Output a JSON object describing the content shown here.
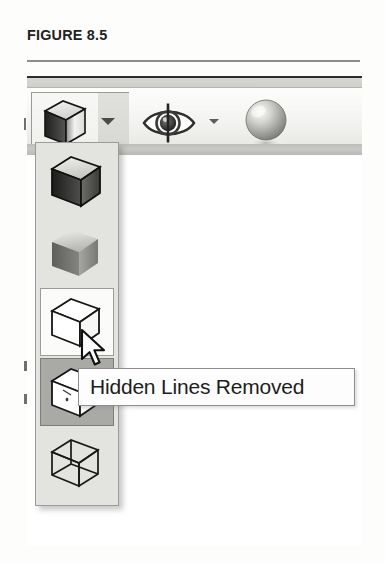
{
  "figure": {
    "caption": "FIGURE 8.5"
  },
  "toolbar": {
    "name": "view-styles-toolbar",
    "buttons": [
      {
        "id": "visual-style-cube",
        "icon": "shaded-cube-icon",
        "label": "Visual Style"
      },
      {
        "id": "visual-style-dropdown",
        "icon": "chevron-down-icon",
        "label": "Visual Style Dropdown"
      },
      {
        "id": "visibility-eye",
        "icon": "eye-icon",
        "label": "Visibility"
      },
      {
        "id": "visibility-dropdown",
        "icon": "chevron-down-icon",
        "label": "Visibility Dropdown"
      },
      {
        "id": "shading-sphere",
        "icon": "sphere-icon",
        "label": "Shading"
      }
    ]
  },
  "flyout": {
    "name": "visual-style-flyout",
    "items": [
      {
        "id": "realistic",
        "icon": "shaded-cube-dark-icon",
        "state": "normal"
      },
      {
        "id": "shaded",
        "icon": "shaded-cube-light-icon",
        "state": "normal"
      },
      {
        "id": "shaded-with-edges",
        "icon": "outline-cube-icon",
        "state": "hovered"
      },
      {
        "id": "hidden-lines-removed",
        "icon": "hidden-line-cube-icon",
        "state": "selected"
      },
      {
        "id": "wireframe",
        "icon": "wireframe-cube-icon",
        "state": "normal"
      }
    ]
  },
  "tooltip": {
    "name": "hidden-lines-removed-tooltip",
    "text": "Hidden Lines Removed"
  },
  "cursor": {
    "name": "mouse-pointer",
    "type": "arrow"
  },
  "colors": {
    "panel_bg": "#e3e3e0",
    "panel_border": "#9b9b98",
    "selected_bg": "#a9a9a6",
    "toolbar_band": "#c9c9c6",
    "rule": "#8d8d8b",
    "text": "#222221"
  }
}
